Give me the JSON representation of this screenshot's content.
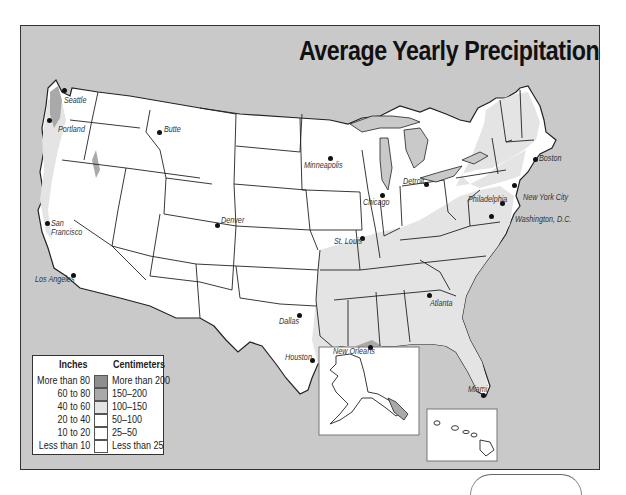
{
  "map": {
    "title": "Average Yearly Precipitation",
    "colors": {
      "background_ocean": "#c9c9c9",
      "land_base": "#ffffff",
      "band_more_than_80": "#8e8e8e",
      "band_60_to_80": "#a9a9a9",
      "band_40_to_60": "#e4e4e4",
      "band_20_to_40": "#ffffff",
      "band_10_to_20": "#ffffff",
      "band_less_than_10": "#ffffff",
      "border": "#222222"
    },
    "cities": [
      {
        "name": "Seattle"
      },
      {
        "name": "Portland"
      },
      {
        "name": "Butte"
      },
      {
        "name": "San Francisco"
      },
      {
        "name": "Los Angeles"
      },
      {
        "name": "Denver"
      },
      {
        "name": "Minneapolis"
      },
      {
        "name": "Chicago"
      },
      {
        "name": "Detroit"
      },
      {
        "name": "St. Louis"
      },
      {
        "name": "Boston"
      },
      {
        "name": "New York City"
      },
      {
        "name": "Philadelphia"
      },
      {
        "name": "Washington, D.C."
      },
      {
        "name": "Atlanta"
      },
      {
        "name": "Dallas"
      },
      {
        "name": "Houston"
      },
      {
        "name": "New Orleans"
      },
      {
        "name": "Miami"
      }
    ],
    "legend": {
      "inches_header": "Inches",
      "cm_header": "Centimeters",
      "rows": [
        {
          "inches": "More than 80",
          "cm": "More than 200",
          "color": "#8e8e8e"
        },
        {
          "inches": "60 to 80",
          "cm": "150–200",
          "color": "#a9a9a9"
        },
        {
          "inches": "40 to 60",
          "cm": "100–150",
          "color": "#e4e4e4"
        },
        {
          "inches": "20 to 40",
          "cm": "50–100",
          "color": "#ffffff"
        },
        {
          "inches": "10 to 20",
          "cm": "25–50",
          "color": "#ffffff"
        },
        {
          "inches": "Less than 10",
          "cm": "Less than 25",
          "color": "#ffffff"
        }
      ]
    },
    "insets": [
      {
        "name": "Alaska"
      },
      {
        "name": "Hawaii"
      }
    ]
  }
}
